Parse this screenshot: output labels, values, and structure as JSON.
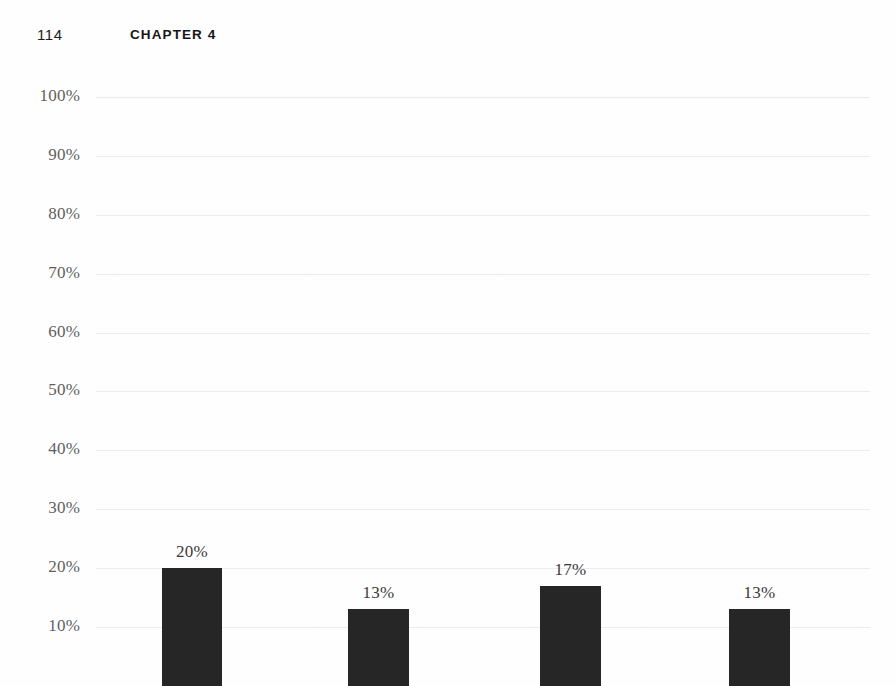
{
  "page": {
    "folio": "114",
    "running_head": "CHAPTER 4"
  },
  "chart_data": {
    "type": "bar",
    "title": "",
    "subtitle": "",
    "xlabel": "",
    "ylabel": "",
    "categories": [
      "",
      "",
      "",
      ""
    ],
    "values": [
      20,
      13,
      17,
      13
    ],
    "data_labels": [
      "20%",
      "13%",
      "17%",
      "13%"
    ],
    "ylim": [
      0,
      100
    ],
    "ytick_values": [
      100,
      90,
      80,
      70,
      60,
      50,
      40,
      30,
      20,
      10
    ],
    "ytick_labels": [
      "100%",
      "90%",
      "80%",
      "70%",
      "60%",
      "50%",
      "40%",
      "30%",
      "20%",
      "10%"
    ],
    "grid": true,
    "grid_axis": "y",
    "legend": null,
    "legend_position": "none",
    "bar_color": "#262626",
    "gridline_color": "#e9e9e9",
    "tick_label_color": "#5f5f5f",
    "note": "Bottom of figure is cropped by the page edge; category axis labels are not visible."
  }
}
